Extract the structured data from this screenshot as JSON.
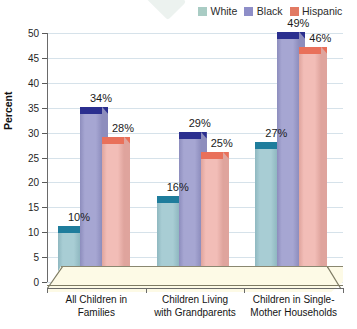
{
  "chart_data": {
    "type": "bar",
    "title": "",
    "subtitle": "",
    "xlabel": "",
    "ylabel": "Percent",
    "ylim": [
      0,
      50
    ],
    "ytick_step": 5,
    "yticks": [
      "0",
      "5",
      "10",
      "15",
      "20",
      "25",
      "30",
      "35",
      "40",
      "45",
      "50"
    ],
    "grid": true,
    "legend_position": "top-right",
    "value_suffix": "%",
    "style": "3d-column",
    "categories": [
      "All Children in\nFamilies",
      "Children Living\nwith Grandparents",
      "Children in Single-\nMother Households"
    ],
    "series": [
      {
        "name": "White",
        "color": "#a8cdd4",
        "cap_color": "#1f7d9c",
        "side_color": "#8fb8c0",
        "swatch_color": "#a9ccc4",
        "values": [
          10,
          16,
          27
        ],
        "labels": [
          "10%",
          "16%",
          "27%"
        ]
      },
      {
        "name": "Black",
        "color": "#a6a6d2",
        "cap_color": "#2b2f8f",
        "side_color": "#8d8dbd",
        "swatch_color": "#8e8ec8",
        "values": [
          34,
          29,
          49
        ],
        "labels": [
          "34%",
          "29%",
          "49%"
        ]
      },
      {
        "name": "Hispanic",
        "color": "#f2bdb7",
        "cap_color": "#e9705a",
        "side_color": "#dfa49d",
        "swatch_color": "#e27a63",
        "values": [
          28,
          25,
          46
        ],
        "labels": [
          "28%",
          "25%",
          "46%"
        ]
      }
    ],
    "colors": {
      "plot_background": "#ffffff",
      "floor": "#fdfae6",
      "gridline": "#d6e2ea",
      "axis": "#6a6a6a",
      "text": "#1a1a1a"
    }
  }
}
